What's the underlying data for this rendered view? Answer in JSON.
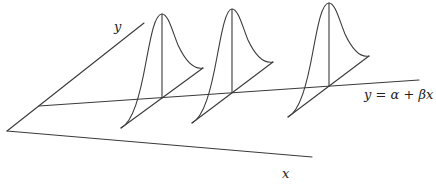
{
  "diagram": {
    "title": "",
    "labels": {
      "y_axis": "y",
      "x_axis": "x",
      "regression_line": "y = α + βx"
    },
    "axes": {
      "origin": [
        7,
        131
      ],
      "y_axis_end": [
        144,
        23
      ],
      "x_axis_end": [
        312,
        157
      ]
    },
    "regression_line": {
      "start": [
        39,
        106
      ],
      "end": [
        419,
        80
      ]
    },
    "density_curves": [
      {
        "id": 1,
        "base": [
          162,
          98
        ],
        "peak": [
          162,
          14
        ],
        "left_end": [
          121,
          128
        ],
        "right_end": [
          203,
          68
        ]
      },
      {
        "id": 2,
        "base": [
          232,
          92
        ],
        "peak": [
          232,
          9
        ],
        "left_end": [
          192,
          123
        ],
        "right_end": [
          273,
          62
        ]
      },
      {
        "id": 3,
        "base": [
          329,
          86
        ],
        "peak": [
          329,
          3
        ],
        "left_end": [
          288,
          117
        ],
        "right_end": [
          369,
          56
        ]
      }
    ],
    "colors": {
      "stroke": "#3a3a3a",
      "background": "#ffffff"
    }
  }
}
